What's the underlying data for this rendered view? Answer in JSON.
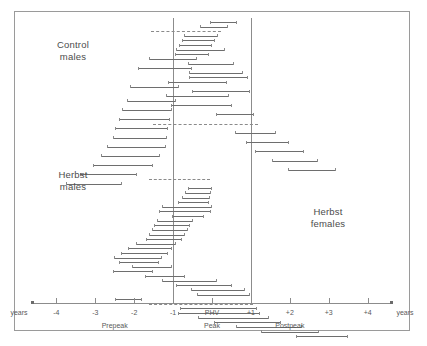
{
  "figure": {
    "background": "#ffffff",
    "frame_color": "#9a9a9a",
    "line_color": "#6e6e6e",
    "text_color": "#4c4c4c"
  },
  "captions": [
    {
      "name": "control-males",
      "text": "Control\nmales",
      "x": 72,
      "y": 38
    },
    {
      "name": "herbst-males",
      "text": "Herbst\nmales",
      "x": 72,
      "y": 168
    },
    {
      "name": "herbst-females",
      "text": "Herbst\nfemales",
      "x": 327,
      "y": 205
    }
  ],
  "reference_lines": [
    {
      "name": "vline-minus1",
      "value": -1,
      "x": 185,
      "y": 6,
      "height": 286
    },
    {
      "name": "vline-plus1",
      "value": 1,
      "x": 263,
      "y": 6,
      "height": 286
    }
  ],
  "chart_data": {
    "type": "bar",
    "title": "",
    "subtitle": "",
    "xlabel": "years",
    "ylabel": "",
    "grid": false,
    "legend": "none",
    "xlim": [
      -4.6,
      4.6
    ],
    "axis": {
      "tick_values": [
        -4,
        -3,
        -2,
        -1,
        0,
        1,
        2,
        3,
        4
      ],
      "tick_labels": [
        "-4",
        "-3",
        "-2",
        "-1",
        "PHV",
        "+1",
        "+2",
        "+3",
        "+4"
      ],
      "left_unit_label": "years",
      "right_unit_label": "years",
      "phases": [
        {
          "label": "Prepeak",
          "center": -2.5
        },
        {
          "label": "Peak",
          "center": 0.0
        },
        {
          "label": "Postpeak",
          "center": 2.0
        }
      ]
    },
    "groups": [
      {
        "name": "Control males",
        "rows": [
          {
            "start": -0.05,
            "end": 0.62,
            "style": "solid"
          },
          {
            "start": -0.3,
            "end": 0.38,
            "style": "solid"
          },
          {
            "start": -1.58,
            "end": 0.22,
            "style": "dashed"
          },
          {
            "start": -0.72,
            "end": 0.12,
            "style": "solid"
          },
          {
            "start": -0.78,
            "end": 0.05,
            "style": "solid"
          },
          {
            "start": -0.85,
            "end": -0.02,
            "style": "solid"
          },
          {
            "start": -0.92,
            "end": 0.3,
            "style": "solid"
          },
          {
            "start": -0.95,
            "end": -0.1,
            "style": "solid"
          },
          {
            "start": -1.62,
            "end": -0.4,
            "style": "solid"
          },
          {
            "start": -0.62,
            "end": 0.55,
            "style": "solid"
          },
          {
            "start": -1.9,
            "end": -0.55,
            "style": "solid"
          },
          {
            "start": -0.6,
            "end": 0.78,
            "style": "solid"
          },
          {
            "start": -0.58,
            "end": 0.9,
            "style": "solid"
          },
          {
            "start": -1.12,
            "end": 0.35,
            "style": "solid"
          },
          {
            "start": -2.1,
            "end": -0.88,
            "style": "solid"
          },
          {
            "start": -0.52,
            "end": 0.95,
            "style": "solid"
          },
          {
            "start": -1.18,
            "end": 0.42,
            "style": "solid"
          },
          {
            "start": -2.18,
            "end": -0.95,
            "style": "solid"
          },
          {
            "start": -1.05,
            "end": 0.48,
            "style": "solid"
          },
          {
            "start": -2.32,
            "end": -1.05,
            "style": "solid"
          },
          {
            "start": 0.1,
            "end": 1.05,
            "style": "solid"
          },
          {
            "start": -2.38,
            "end": -1.1,
            "style": "solid"
          },
          {
            "start": -1.52,
            "end": 1.18,
            "style": "dashed"
          },
          {
            "start": -2.48,
            "end": -1.15,
            "style": "solid"
          },
          {
            "start": 0.6,
            "end": 1.62,
            "style": "solid"
          },
          {
            "start": -2.55,
            "end": -1.18,
            "style": "solid"
          },
          {
            "start": 0.88,
            "end": 1.95,
            "style": "solid"
          },
          {
            "start": -2.7,
            "end": -1.22,
            "style": "solid"
          },
          {
            "start": 1.1,
            "end": 2.35,
            "style": "solid"
          },
          {
            "start": -2.85,
            "end": -1.35,
            "style": "solid"
          },
          {
            "start": 1.55,
            "end": 2.7,
            "style": "solid"
          },
          {
            "start": -3.05,
            "end": -1.55,
            "style": "solid"
          },
          {
            "start": 1.95,
            "end": 3.15,
            "style": "solid"
          },
          {
            "start": -3.4,
            "end": -1.95,
            "style": "solid"
          },
          {
            "start": -1.62,
            "end": -0.05,
            "style": "dashed"
          },
          {
            "start": -3.75,
            "end": -2.35,
            "style": "solid"
          }
        ]
      },
      {
        "name": "Herbst males",
        "rows": [
          {
            "start": -0.62,
            "end": -0.02,
            "style": "solid"
          },
          {
            "start": -0.7,
            "end": -0.05,
            "style": "solid"
          },
          {
            "start": -0.78,
            "end": -0.08,
            "style": "solid"
          },
          {
            "start": -0.88,
            "end": -0.1,
            "style": "solid"
          },
          {
            "start": -1.28,
            "end": -0.02,
            "style": "solid"
          },
          {
            "start": -1.35,
            "end": -0.05,
            "style": "solid"
          },
          {
            "start": -1.02,
            "end": -0.22,
            "style": "solid"
          },
          {
            "start": -1.42,
            "end": -0.52,
            "style": "solid"
          },
          {
            "start": -1.48,
            "end": -0.58,
            "style": "solid"
          },
          {
            "start": -1.55,
            "end": -0.65,
            "style": "solid"
          },
          {
            "start": -1.62,
            "end": -0.72,
            "style": "solid"
          },
          {
            "start": -1.7,
            "end": -0.8,
            "style": "solid"
          },
          {
            "start": -1.95,
            "end": -0.95,
            "style": "solid"
          },
          {
            "start": -2.15,
            "end": -1.05,
            "style": "solid"
          },
          {
            "start": -2.35,
            "end": -1.15,
            "style": "solid"
          },
          {
            "start": -2.52,
            "end": -1.3,
            "style": "solid"
          }
        ]
      },
      {
        "name": "Herbst females",
        "rows": [
          {
            "start": -2.38,
            "end": -1.38,
            "style": "solid"
          },
          {
            "start": -2.05,
            "end": -1.05,
            "style": "solid"
          },
          {
            "start": -2.55,
            "end": -1.55,
            "style": "solid"
          },
          {
            "start": -1.72,
            "end": -0.72,
            "style": "solid"
          },
          {
            "start": -1.28,
            "end": 0.1,
            "style": "solid"
          },
          {
            "start": -0.92,
            "end": 0.48,
            "style": "solid"
          },
          {
            "start": -0.55,
            "end": 0.82,
            "style": "solid"
          },
          {
            "start": -0.38,
            "end": 0.95,
            "style": "solid"
          },
          {
            "start": -2.48,
            "end": -1.82,
            "style": "solid"
          },
          {
            "start": -1.62,
            "end": 1.05,
            "style": "dashed"
          },
          {
            "start": -0.82,
            "end": 1.12,
            "style": "solid"
          },
          {
            "start": -0.88,
            "end": 1.22,
            "style": "solid"
          },
          {
            "start": -0.35,
            "end": 1.45,
            "style": "solid"
          },
          {
            "start": 0.05,
            "end": 1.75,
            "style": "solid"
          },
          {
            "start": 0.62,
            "end": 2.28,
            "style": "solid"
          },
          {
            "start": 1.25,
            "end": 2.72,
            "style": "solid"
          },
          {
            "start": 2.15,
            "end": 3.48,
            "style": "solid"
          }
        ]
      }
    ]
  }
}
